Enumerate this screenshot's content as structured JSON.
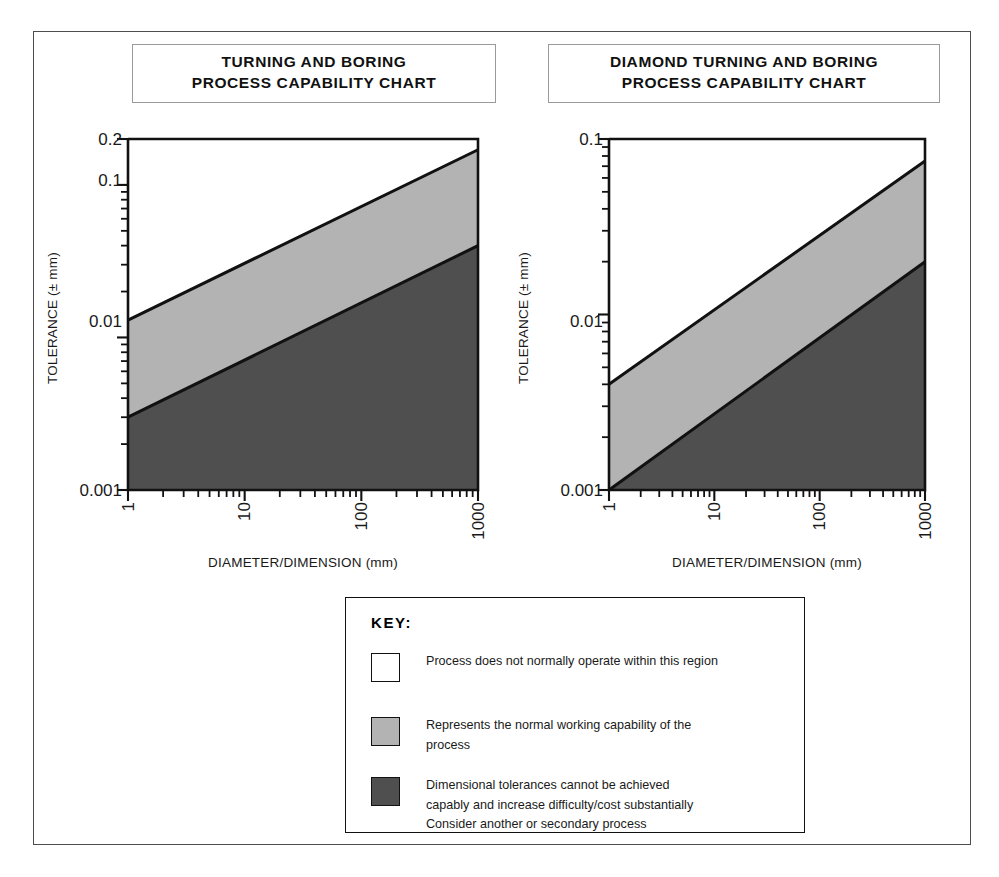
{
  "figure": {
    "background_color": "#ffffff",
    "frame_color": "#4d4d4d"
  },
  "colors": {
    "white_region": "#ffffff",
    "light_gray_region": "#b3b3b3",
    "dark_gray_region": "#4f4f4f",
    "line": "#111111",
    "text": "#1a1a1a"
  },
  "charts": [
    {
      "title_line_1": "TURNING AND BORING",
      "title_line_2": "PROCESS CAPABILITY CHART",
      "xlabel": "DIAMETER/DIMENSION (mm)",
      "ylabel": "TOLERANCE (± mm)",
      "y_ticks": [
        "0.2",
        "0.1",
        "0.01",
        "0.001"
      ],
      "x_ticks": [
        "1",
        "10",
        "100",
        "1000"
      ]
    },
    {
      "title_line_1": "DIAMOND TURNING AND BORING",
      "title_line_2": "PROCESS CAPABILITY CHART",
      "xlabel": "DIAMETER/DIMENSION (mm)",
      "ylabel": "TOLERANCE (± mm)",
      "y_ticks": [
        "0.1",
        "0.01",
        "0.001"
      ],
      "x_ticks": [
        "1",
        "10",
        "100",
        "1000"
      ]
    }
  ],
  "key": {
    "title": "KEY:",
    "entries": [
      {
        "swatch": "white",
        "swatch_color": "#ffffff",
        "text": "Process does not normally operate within this region"
      },
      {
        "swatch": "light-gray",
        "swatch_color": "#b3b3b3",
        "text": "Represents the normal working capability of the\nprocess"
      },
      {
        "swatch": "dark-gray",
        "swatch_color": "#4f4f4f",
        "text": "Dimensional tolerances cannot be achieved\ncapably and increase difficulty/cost substantially\nConsider another or secondary process"
      }
    ]
  },
  "chart_data": [
    {
      "type": "area",
      "title": "TURNING AND BORING PROCESS CAPABILITY CHART",
      "xlabel": "DIAMETER/DIMENSION (mm)",
      "ylabel": "TOLERANCE (± mm)",
      "xscale": "log",
      "yscale": "log",
      "xlim": [
        1,
        1000
      ],
      "ylim": [
        0.001,
        0.2
      ],
      "x_tick_labels": [
        "1",
        "10",
        "100",
        "1000"
      ],
      "y_tick_labels": [
        "0.001",
        "0.01",
        "0.1",
        "0.2"
      ],
      "grid": false,
      "legend_position": "below-figure",
      "series": [
        {
          "name": "upper boundary (top of normal working capability band)",
          "x": [
            1,
            1000
          ],
          "y": [
            0.013,
            0.17
          ]
        },
        {
          "name": "lower boundary (bottom of normal working capability band)",
          "x": [
            1,
            1000
          ],
          "y": [
            0.003,
            0.04
          ]
        }
      ],
      "regions": [
        {
          "name": "Process does not normally operate within this region",
          "fill": "#ffffff",
          "bounded_by": "above upper boundary"
        },
        {
          "name": "Represents the normal working capability of the process",
          "fill": "#b3b3b3",
          "bounded_by": "between upper and lower boundary"
        },
        {
          "name": "Dimensional tolerances cannot be achieved capably",
          "fill": "#4f4f4f",
          "bounded_by": "below lower boundary"
        }
      ]
    },
    {
      "type": "area",
      "title": "DIAMOND TURNING AND BORING PROCESS CAPABILITY CHART",
      "xlabel": "DIAMETER/DIMENSION (mm)",
      "ylabel": "TOLERANCE (± mm)",
      "xscale": "log",
      "yscale": "log",
      "xlim": [
        1,
        1000
      ],
      "ylim": [
        0.001,
        0.1
      ],
      "x_tick_labels": [
        "1",
        "10",
        "100",
        "1000"
      ],
      "y_tick_labels": [
        "0.001",
        "0.01",
        "0.1"
      ],
      "grid": false,
      "legend_position": "below-figure",
      "series": [
        {
          "name": "upper boundary (top of normal working capability band)",
          "x": [
            1,
            1000
          ],
          "y": [
            0.004,
            0.075
          ]
        },
        {
          "name": "lower boundary (bottom of normal working capability band)",
          "x": [
            1,
            1000
          ],
          "y": [
            0.001,
            0.02
          ]
        }
      ],
      "regions": [
        {
          "name": "Process does not normally operate within this region",
          "fill": "#ffffff",
          "bounded_by": "above upper boundary"
        },
        {
          "name": "Represents the normal working capability of the process",
          "fill": "#b3b3b3",
          "bounded_by": "between upper and lower boundary"
        },
        {
          "name": "Dimensional tolerances cannot be achieved capably",
          "fill": "#4f4f4f",
          "bounded_by": "below lower boundary"
        }
      ]
    }
  ]
}
